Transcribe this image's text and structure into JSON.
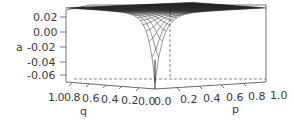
{
  "chart_data": {
    "type": "surface3d",
    "title": "",
    "zlabel": "a",
    "xlabel": "q",
    "ylabel": "p",
    "z_ticks": [
      "0.02",
      "0.00",
      "-0.02",
      "-0.04",
      "-0.06"
    ],
    "z_tick_values": [
      0.02,
      0.0,
      -0.02,
      -0.04,
      -0.06
    ],
    "q_ticks": [
      "1.0",
      "0.8",
      "0.6",
      "0.4",
      "0.2",
      "0.0"
    ],
    "p_ticks": [
      "0.0",
      "0.2",
      "0.4",
      "0.6",
      "0.8",
      "1.0"
    ],
    "q_range": [
      0,
      1
    ],
    "p_range": [
      0,
      1
    ],
    "z_range": [
      -0.07,
      0.03
    ],
    "surface_samples": [
      {
        "p": 1.0,
        "q": 1.0,
        "a": 0.025
      },
      {
        "p": 0.5,
        "q": 0.5,
        "a": 0.024
      },
      {
        "p": 0.2,
        "q": 0.2,
        "a": 0.018
      },
      {
        "p": 0.1,
        "q": 0.1,
        "a": 0.008
      },
      {
        "p": 0.05,
        "q": 0.05,
        "a": -0.01
      },
      {
        "p": 0.0,
        "q": 0.0,
        "a": -0.065
      },
      {
        "p": 1.0,
        "q": 0.0,
        "a": 0.01
      },
      {
        "p": 0.0,
        "q": 1.0,
        "a": 0.01
      }
    ],
    "grid": false,
    "box": true,
    "colors": {
      "mesh": "#222222",
      "axis": "#555555",
      "dashed": "#666666",
      "text": "#3a3a3a"
    }
  }
}
